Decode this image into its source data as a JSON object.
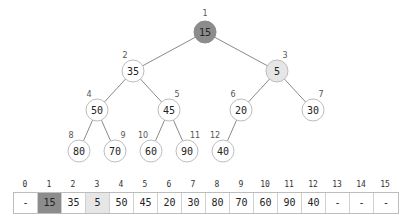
{
  "colors": {
    "root_fill": "#8c8c8c",
    "highlight_fill": "#e6e6e6",
    "edge": "#8a8a8a",
    "node_stroke": "#bdbdbd"
  },
  "tree": {
    "nodes": [
      {
        "index": "1",
        "value": "15",
        "x": 205,
        "y": 32,
        "state": "root"
      },
      {
        "index": "2",
        "value": "35",
        "x": 133,
        "y": 71,
        "state": "normal"
      },
      {
        "index": "3",
        "value": "5",
        "x": 277,
        "y": 71,
        "state": "highlight"
      },
      {
        "index": "4",
        "value": "50",
        "x": 97,
        "y": 110,
        "state": "normal"
      },
      {
        "index": "5",
        "value": "45",
        "x": 169,
        "y": 110,
        "state": "normal"
      },
      {
        "index": "6",
        "value": "20",
        "x": 241,
        "y": 110,
        "state": "normal"
      },
      {
        "index": "7",
        "value": "30",
        "x": 313,
        "y": 110,
        "state": "normal"
      },
      {
        "index": "8",
        "value": "80",
        "x": 79,
        "y": 151,
        "state": "normal"
      },
      {
        "index": "9",
        "value": "70",
        "x": 115,
        "y": 151,
        "state": "normal"
      },
      {
        "index": "10",
        "value": "60",
        "x": 151,
        "y": 151,
        "state": "normal"
      },
      {
        "index": "11",
        "value": "90",
        "x": 187,
        "y": 151,
        "state": "normal"
      },
      {
        "index": "12",
        "value": "40",
        "x": 223,
        "y": 151,
        "state": "normal"
      }
    ],
    "edges": [
      [
        1,
        2
      ],
      [
        1,
        3
      ],
      [
        2,
        4
      ],
      [
        2,
        5
      ],
      [
        3,
        6
      ],
      [
        3,
        7
      ],
      [
        4,
        8
      ],
      [
        4,
        9
      ],
      [
        5,
        10
      ],
      [
        5,
        11
      ],
      [
        6,
        12
      ]
    ]
  },
  "array": {
    "indices": [
      "0",
      "1",
      "2",
      "3",
      "4",
      "5",
      "6",
      "7",
      "8",
      "9",
      "10",
      "11",
      "12",
      "13",
      "14",
      "15"
    ],
    "values": [
      "-",
      "15",
      "35",
      "5",
      "50",
      "45",
      "20",
      "30",
      "80",
      "70",
      "60",
      "90",
      "40",
      "-",
      "-",
      "-"
    ],
    "states": [
      "normal",
      "root",
      "normal",
      "highlight",
      "normal",
      "normal",
      "normal",
      "normal",
      "normal",
      "normal",
      "normal",
      "normal",
      "normal",
      "normal",
      "normal",
      "normal"
    ]
  }
}
